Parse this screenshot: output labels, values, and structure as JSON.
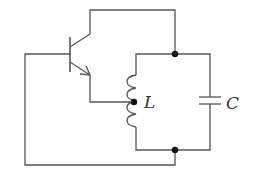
{
  "diagram": {
    "type": "circuit",
    "components": {
      "transistor": {
        "kind": "NPN transistor"
      },
      "inductor": {
        "label": "L",
        "tapped": true
      },
      "capacitor": {
        "label": "C"
      }
    },
    "labels": {
      "inductor": "L",
      "capacitor": "C"
    },
    "colors": {
      "wire": "#555555",
      "node": "#111111",
      "text": "#333333"
    }
  }
}
